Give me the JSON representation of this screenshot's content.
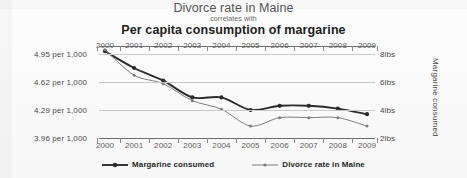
{
  "title": {
    "line1": "Divorce rate in Maine",
    "line2": "correlates with",
    "line3": "Per capita consumption of margarine"
  },
  "axis_titles": {
    "left": "Divorce rate in Maine",
    "right": "Margarine consumed"
  },
  "legend": [
    {
      "label": "Margarine consumed",
      "color": "#2b2b2b"
    },
    {
      "label": "Divorce rate in Maine",
      "color": "#7d7d7d"
    }
  ],
  "chart_data": {
    "type": "line",
    "title": "Divorce rate in Maine correlates with Per capita consumption of margarine",
    "subtitle": "correlates with",
    "xlabel": "",
    "ylabel": "Divorce rate in Maine",
    "y2label": "Margarine consumed",
    "grid": true,
    "legend_position": "bottom",
    "x": [
      2000,
      2001,
      2002,
      2003,
      2004,
      2005,
      2006,
      2007,
      2008,
      2009
    ],
    "categories": [
      "2000",
      "2001",
      "2002",
      "2003",
      "2004",
      "2005",
      "2006",
      "2007",
      "2008",
      "2009"
    ],
    "x_tick_labels_top": [
      "2000",
      "2001",
      "2002",
      "2003",
      "2004",
      "2005",
      "2006",
      "2007",
      "2008",
      "2009"
    ],
    "x_tick_labels_bottom": [
      "2000",
      "2001",
      "2002",
      "2003",
      "2004",
      "2005",
      "2006",
      "2007",
      "2008",
      "2009"
    ],
    "y_left_ticks": [
      "4.95 per 1,000",
      "4.62 per 1,000",
      "4.29 per 1,000",
      "3.96 per 1,000"
    ],
    "y_left_values": [
      4.95,
      4.62,
      4.29,
      3.96
    ],
    "ylim": [
      3.96,
      4.95
    ],
    "y_right_ticks": [
      "8lbs",
      "6lbs",
      "4lbs",
      "2lbs"
    ],
    "y_right_values": [
      8,
      6,
      4,
      2
    ],
    "y2lim": [
      2,
      8
    ],
    "series": [
      {
        "name": "Margarine consumed",
        "axis": "right",
        "unit": "lbs",
        "color": "#2b2b2b",
        "values": [
          8.2,
          7.0,
          6.1,
          4.9,
          4.9,
          4.0,
          4.3,
          4.3,
          4.1,
          3.7
        ]
      },
      {
        "name": "Divorce rate in Maine",
        "axis": "left",
        "unit": "per 1,000",
        "color": "#7d7d7d",
        "values": [
          5.0,
          4.7,
          4.6,
          4.4,
          4.3,
          4.1,
          4.2,
          4.2,
          4.2,
          4.1
        ]
      }
    ]
  }
}
